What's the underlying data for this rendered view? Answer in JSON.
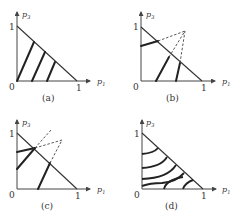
{
  "figure": {
    "panels": [
      {
        "id": "a",
        "caption": "(a)",
        "x_axis_label": "p1",
        "y_axis_label": "p3",
        "x_label_main": "p",
        "x_label_sub": "1",
        "y_label_main": "p",
        "y_label_sub": "3",
        "origin_label": "0",
        "x_tick_label": "1",
        "y_tick_label": "1",
        "description": "Three parallel thick lines (indifference curves) inside the probability triangle"
      },
      {
        "id": "b",
        "caption": "(b)",
        "x_axis_label": "p1",
        "y_axis_label": "p3",
        "x_label_main": "p",
        "x_label_sub": "1",
        "y_label_main": "p",
        "y_label_sub": "3",
        "origin_label": "0",
        "x_tick_label": "1",
        "y_tick_label": "1",
        "description": "Indifference lines fanning out from a point outside the triangle (dashed extensions converge)"
      },
      {
        "id": "c",
        "caption": "(c)",
        "x_axis_label": "p1",
        "y_axis_label": "p3",
        "x_label_main": "p",
        "x_label_sub": "1",
        "y_label_main": "p",
        "y_label_sub": "3",
        "origin_label": "0",
        "x_tick_label": "1",
        "y_tick_label": "1",
        "description": "Indifference lines converging at a point on the hypotenuse, with dashed extensions"
      },
      {
        "id": "d",
        "caption": "(d)",
        "x_axis_label": "p1",
        "y_axis_label": "p3",
        "x_label_main": "p",
        "x_label_sub": "1",
        "y_label_main": "p",
        "y_label_sub": "3",
        "origin_label": "0",
        "x_tick_label": "1",
        "y_tick_label": "1",
        "description": "Five curved (nonlinear) indifference curves inside the triangle"
      }
    ]
  }
}
